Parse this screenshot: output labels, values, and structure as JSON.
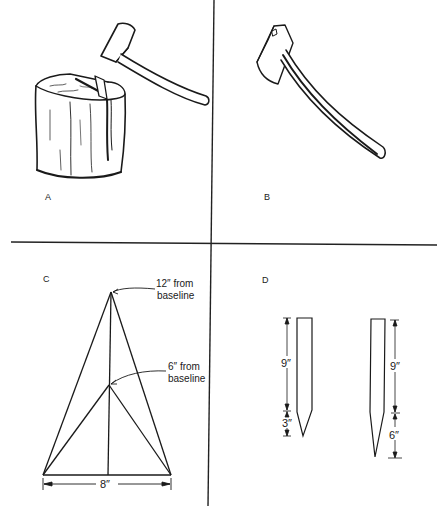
{
  "figure": {
    "panels": [
      {
        "id": "A",
        "label": "A",
        "description": "Hand axe splitting a log on a chopping block"
      },
      {
        "id": "B",
        "label": "B",
        "description": "Hatchet / hand axe"
      },
      {
        "id": "C",
        "label": "C",
        "description": "Triangle construction guide with 8 inch base",
        "annotations": {
          "upper_line1": "12″ from",
          "upper_line2": "baseline",
          "lower_line1": "6″ from",
          "lower_line2": "baseline",
          "base_dimension": "8″"
        }
      },
      {
        "id": "D",
        "label": "D",
        "description": "Two stakes with pointed ends and dimensions",
        "stakes": [
          {
            "shaft": "9″",
            "point": "3″"
          },
          {
            "shaft": "9″",
            "point": "6″"
          }
        ]
      }
    ]
  },
  "colors": {
    "ink": "#1a1a1a",
    "background": "#ffffff"
  }
}
